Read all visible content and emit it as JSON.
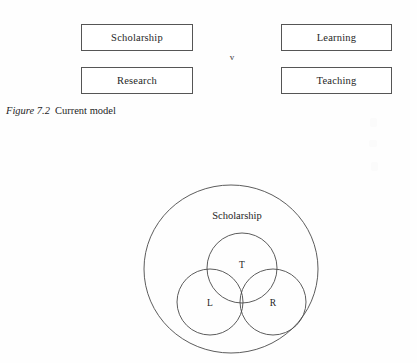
{
  "figure_top": {
    "boxes": [
      {
        "id": "scholarship",
        "label": "Scholarship"
      },
      {
        "id": "research",
        "label": "Research"
      },
      {
        "id": "learning",
        "label": "Learning"
      },
      {
        "id": "teaching",
        "label": "Teaching"
      }
    ],
    "divider_label": "v"
  },
  "caption": {
    "number": "Figure 7.2",
    "text": "Current model"
  },
  "figure_bottom": {
    "outer_label": "Scholarship",
    "circles": [
      {
        "id": "t",
        "label": "T"
      },
      {
        "id": "l",
        "label": "L"
      },
      {
        "id": "r",
        "label": "R"
      }
    ]
  },
  "colors": {
    "page_background": "#fefefe",
    "box_border": "#555555",
    "diagram_stroke": "#4a4a4a",
    "text": "#242424"
  }
}
